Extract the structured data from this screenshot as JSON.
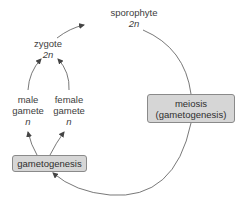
{
  "diagram": {
    "nodes": {
      "sporophyte": {
        "name": "sporophyte",
        "ploidy": "2n"
      },
      "zygote": {
        "name": "zygote",
        "ploidy": "2n"
      },
      "male_gamete": {
        "line1": "male",
        "line2": "gamete",
        "ploidy": "n"
      },
      "female_gamete": {
        "line1": "female",
        "line2": "gamete",
        "ploidy": "n"
      },
      "meiosis_box": {
        "line1": "meiosis",
        "line2": "(gametogenesis)"
      },
      "gametogenesis_box": {
        "label": "gametogenesis"
      }
    },
    "edges": [
      {
        "from": "zygote",
        "to": "sporophyte"
      },
      {
        "from": "male_gamete",
        "to": "zygote"
      },
      {
        "from": "female_gamete",
        "to": "zygote"
      },
      {
        "from": "sporophyte",
        "to": "meiosis_box"
      },
      {
        "from": "meiosis_box",
        "to": "gametogenesis_box"
      },
      {
        "from": "gametogenesis_box",
        "to": "male_gamete"
      },
      {
        "from": "gametogenesis_box",
        "to": "female_gamete"
      }
    ],
    "colors": {
      "line": "#555555",
      "box_fill": "#d6d6d6",
      "box_border": "#8a8a8a",
      "text": "#3d3d3d"
    }
  }
}
